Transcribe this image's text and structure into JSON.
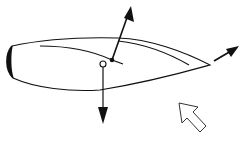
{
  "diagram": {
    "colors": {
      "background": "#ffffff",
      "stroke": "#111111",
      "hollow_arrow_stroke": "#333333"
    },
    "elements": [
      {
        "id": "airfoil-outline",
        "label": ""
      },
      {
        "id": "leading-edge-cap",
        "label": ""
      },
      {
        "id": "camber-line",
        "label": ""
      },
      {
        "id": "upper-inner-line",
        "label": ""
      },
      {
        "id": "pivot-point",
        "label": ""
      },
      {
        "id": "center-of-gravity",
        "label": ""
      },
      {
        "id": "lift-arrow",
        "label": ""
      },
      {
        "id": "weight-arrow",
        "label": ""
      },
      {
        "id": "trailing-edge-arrow",
        "label": ""
      },
      {
        "id": "airflow-arrow",
        "label": ""
      }
    ]
  }
}
